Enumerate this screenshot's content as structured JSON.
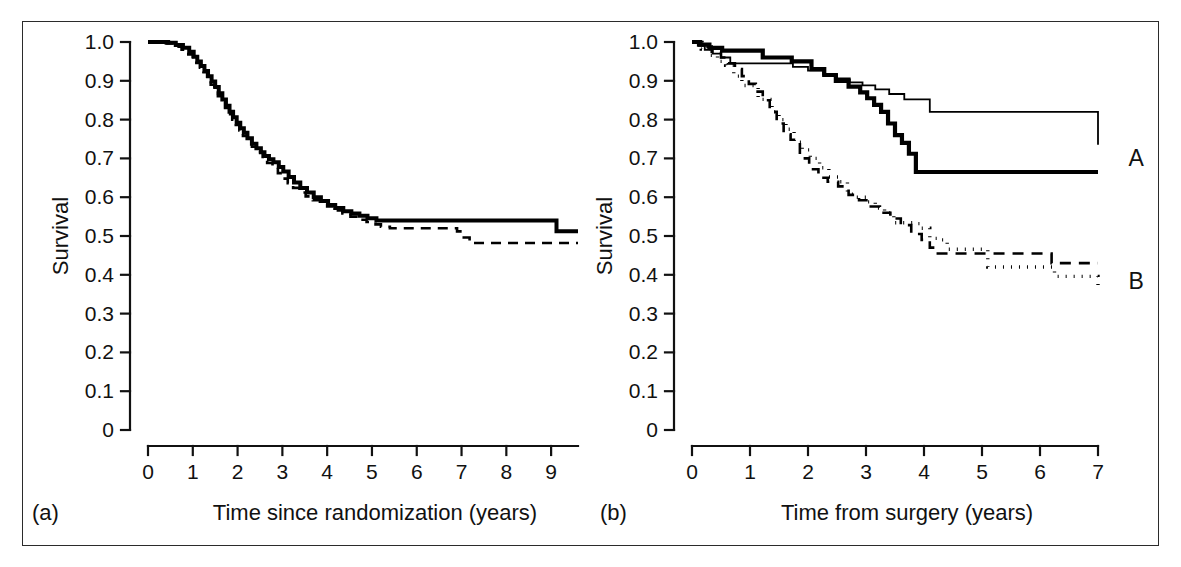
{
  "figure": {
    "title": "",
    "background": "#ffffff",
    "frame_color": "#2b2b2b",
    "ink_color": "#000000"
  },
  "panels": [
    {
      "id": "a",
      "letter": "(a)",
      "xlabel": "Time since randomization (years)",
      "ylabel": "Survival",
      "xticks": [
        "0",
        "1",
        "2",
        "3",
        "4",
        "5",
        "6",
        "7",
        "8",
        "9"
      ],
      "yticks": [
        "1.0",
        "0.9",
        "0.8",
        "0.7",
        "0.6",
        "0.5",
        "0.4",
        "0.3",
        "0.2",
        "0.1",
        "0"
      ],
      "curve_labels": []
    },
    {
      "id": "b",
      "letter": "(b)",
      "xlabel": "Time from surgery (years)",
      "ylabel": "Survival",
      "xticks": [
        "0",
        "1",
        "2",
        "3",
        "4",
        "5",
        "6",
        "7"
      ],
      "yticks": [
        "1.0",
        "0.9",
        "0.8",
        "0.7",
        "0.6",
        "0.5",
        "0.4",
        "0.3",
        "0.2",
        "0.1",
        "0"
      ],
      "curve_labels": [
        {
          "text": "A",
          "x": 7.25,
          "y": 0.7
        },
        {
          "text": "B",
          "x": 7.25,
          "y": 0.385
        }
      ]
    }
  ],
  "chart_data": [
    {
      "type": "line",
      "panel": "a",
      "title": "",
      "subtitle": "",
      "xlabel": "Time since randomization (years)",
      "ylabel": "Survival",
      "xlim": [
        0,
        9.6
      ],
      "ylim": [
        0,
        1.0
      ],
      "xticks": [
        0,
        1,
        2,
        3,
        4,
        5,
        6,
        7,
        8,
        9
      ],
      "yticks": [
        0,
        0.1,
        0.2,
        0.3,
        0.4,
        0.5,
        0.6,
        0.7,
        0.8,
        0.9,
        1.0
      ],
      "grid": false,
      "legend": "none",
      "step": "post",
      "annotations": [
        "(a)"
      ],
      "series": [
        {
          "name": "Kaplan-Meier estimate (solid)",
          "style": "solid",
          "width": 4.0,
          "x": [
            0.0,
            0.45,
            0.62,
            0.78,
            0.92,
            1.02,
            1.1,
            1.18,
            1.26,
            1.34,
            1.42,
            1.5,
            1.58,
            1.66,
            1.74,
            1.82,
            1.9,
            1.98,
            2.06,
            2.14,
            2.22,
            2.32,
            2.42,
            2.52,
            2.6,
            2.7,
            2.8,
            2.92,
            3.02,
            3.14,
            3.26,
            3.4,
            3.55,
            3.7,
            3.86,
            4.02,
            4.18,
            4.36,
            4.54,
            4.72,
            4.9,
            5.1,
            5.22,
            7.15,
            9.12,
            9.6
          ],
          "y": [
            1.0,
            0.998,
            0.992,
            0.985,
            0.975,
            0.962,
            0.95,
            0.938,
            0.925,
            0.912,
            0.898,
            0.884,
            0.868,
            0.852,
            0.836,
            0.82,
            0.806,
            0.792,
            0.778,
            0.766,
            0.752,
            0.738,
            0.726,
            0.716,
            0.706,
            0.698,
            0.69,
            0.678,
            0.666,
            0.652,
            0.638,
            0.624,
            0.612,
            0.6,
            0.59,
            0.58,
            0.572,
            0.564,
            0.558,
            0.552,
            0.546,
            0.54,
            0.54,
            0.54,
            0.512,
            0.512
          ]
        },
        {
          "name": "Kaplan-Meier estimate (dashed)",
          "style": "dashed",
          "width": 2.6,
          "dash": "10,7",
          "x": [
            0.0,
            0.4,
            0.6,
            0.75,
            0.9,
            1.0,
            1.08,
            1.16,
            1.24,
            1.32,
            1.4,
            1.48,
            1.56,
            1.64,
            1.72,
            1.8,
            1.88,
            1.96,
            2.04,
            2.12,
            2.22,
            2.32,
            2.44,
            2.56,
            2.66,
            2.78,
            2.9,
            3.0,
            3.12,
            3.24,
            3.38,
            3.52,
            3.68,
            3.84,
            4.0,
            4.16,
            4.34,
            4.52,
            4.7,
            4.88,
            5.08,
            5.2,
            5.4,
            6.9,
            7.05,
            7.18,
            9.6
          ],
          "y": [
            1.0,
            0.996,
            0.988,
            0.98,
            0.968,
            0.958,
            0.946,
            0.934,
            0.922,
            0.906,
            0.89,
            0.874,
            0.86,
            0.846,
            0.83,
            0.814,
            0.8,
            0.786,
            0.772,
            0.758,
            0.744,
            0.73,
            0.716,
            0.7,
            0.688,
            0.676,
            0.662,
            0.648,
            0.636,
            0.624,
            0.612,
            0.602,
            0.592,
            0.584,
            0.576,
            0.566,
            0.558,
            0.55,
            0.542,
            0.536,
            0.53,
            0.524,
            0.52,
            0.512,
            0.496,
            0.482,
            0.482
          ]
        }
      ]
    },
    {
      "type": "line",
      "panel": "b",
      "title": "",
      "subtitle": "",
      "xlabel": "Time from surgery (years)",
      "ylabel": "Survival",
      "xlim": [
        0,
        7.0
      ],
      "ylim": [
        0,
        1.0
      ],
      "xticks": [
        0,
        1,
        2,
        3,
        4,
        5,
        6,
        7
      ],
      "yticks": [
        0,
        0.1,
        0.2,
        0.3,
        0.4,
        0.5,
        0.6,
        0.7,
        0.8,
        0.9,
        1.0
      ],
      "grid": false,
      "legend": "inline-right",
      "step": "post",
      "annotations": [
        "(b)",
        "A",
        "B"
      ],
      "series": [
        {
          "name": "Group A (thick solid)",
          "group": "A",
          "style": "solid",
          "width": 4.2,
          "x": [
            0.0,
            0.14,
            0.3,
            0.52,
            0.72,
            1.22,
            1.72,
            2.06,
            2.28,
            2.48,
            2.7,
            2.9,
            3.02,
            3.14,
            3.26,
            3.38,
            3.5,
            3.62,
            3.74,
            3.86,
            7.0
          ],
          "y": [
            1.0,
            0.993,
            0.985,
            0.978,
            0.978,
            0.96,
            0.95,
            0.93,
            0.915,
            0.9,
            0.885,
            0.87,
            0.855,
            0.838,
            0.82,
            0.79,
            0.76,
            0.74,
            0.712,
            0.665,
            0.665
          ]
        },
        {
          "name": "Group A (thin solid)",
          "group": "A",
          "style": "solid",
          "width": 1.8,
          "x": [
            0.0,
            0.1,
            0.22,
            0.36,
            0.5,
            0.66,
            1.52,
            1.74,
            2.0,
            2.26,
            2.5,
            2.72,
            2.94,
            3.16,
            3.4,
            3.66,
            4.1,
            6.05,
            7.0
          ],
          "y": [
            1.0,
            0.99,
            0.98,
            0.97,
            0.96,
            0.945,
            0.945,
            0.936,
            0.926,
            0.916,
            0.906,
            0.896,
            0.888,
            0.878,
            0.866,
            0.852,
            0.82,
            0.82,
            0.735
          ]
        },
        {
          "name": "Group B (dashed)",
          "group": "B",
          "style": "dashed",
          "width": 2.6,
          "dash": "11,8",
          "x": [
            0.0,
            0.18,
            0.34,
            0.5,
            0.62,
            0.74,
            0.86,
            0.98,
            1.1,
            1.22,
            1.34,
            1.46,
            1.58,
            1.7,
            1.86,
            2.02,
            2.18,
            2.34,
            2.52,
            2.7,
            2.88,
            3.06,
            3.24,
            3.42,
            3.6,
            3.78,
            3.96,
            4.1,
            4.2,
            6.05,
            6.2,
            7.0
          ],
          "y": [
            1.0,
            0.988,
            0.975,
            0.96,
            0.945,
            0.93,
            0.912,
            0.892,
            0.872,
            0.85,
            0.82,
            0.79,
            0.762,
            0.748,
            0.7,
            0.672,
            0.65,
            0.64,
            0.628,
            0.606,
            0.592,
            0.576,
            0.56,
            0.545,
            0.528,
            0.505,
            0.49,
            0.47,
            0.455,
            0.455,
            0.43,
            0.43
          ]
        },
        {
          "name": "Group B (dotted)",
          "group": "B",
          "style": "dotted",
          "width": 3.4,
          "dash": "1,7",
          "x": [
            0.0,
            0.16,
            0.3,
            0.44,
            0.58,
            0.72,
            0.86,
            1.0,
            1.14,
            1.26,
            1.38,
            1.5,
            1.62,
            1.76,
            1.9,
            2.04,
            2.2,
            2.36,
            2.52,
            2.68,
            2.84,
            3.0,
            3.16,
            3.32,
            3.48,
            3.64,
            3.8,
            3.96,
            4.1,
            4.24,
            4.4,
            5.1,
            5.2,
            6.25,
            7.0
          ],
          "y": [
            1.0,
            0.982,
            0.966,
            0.95,
            0.94,
            0.912,
            0.888,
            0.888,
            0.852,
            0.852,
            0.82,
            0.8,
            0.775,
            0.742,
            0.722,
            0.7,
            0.676,
            0.652,
            0.64,
            0.608,
            0.6,
            0.588,
            0.572,
            0.56,
            0.534,
            0.534,
            0.532,
            0.52,
            0.494,
            0.49,
            0.466,
            0.42,
            0.42,
            0.396,
            0.365
          ]
        }
      ]
    }
  ]
}
